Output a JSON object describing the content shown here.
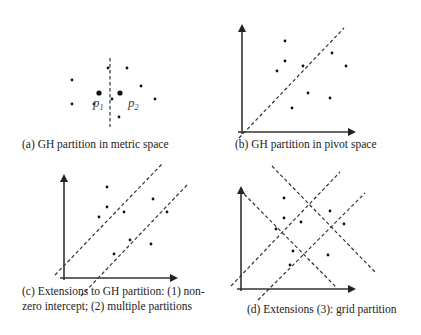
{
  "figure": {
    "panels": [
      {
        "id": "a",
        "caption": "(a) GH partition in metric space",
        "caption_pos": [
          22,
          148
        ],
        "axes": null,
        "dashed_lines": [
          [
            110,
            58,
            110,
            127
          ]
        ],
        "pivots": [
          [
            99,
            93
          ],
          [
            120,
            93
          ]
        ],
        "pivot_labels": [
          {
            "text": "p",
            "sub": "1",
            "x": 93,
            "y": 107
          },
          {
            "text": "p",
            "sub": "2",
            "x": 128,
            "y": 107
          }
        ],
        "points": [
          [
            72,
            80
          ],
          [
            72,
            104
          ],
          [
            94,
            104
          ],
          [
            108,
            68
          ],
          [
            127,
            68
          ],
          [
            141,
            86
          ],
          [
            155,
            99
          ],
          [
            112,
            99
          ],
          [
            119,
            117
          ]
        ]
      },
      {
        "id": "b",
        "caption": "(b) GH partition in pivot space",
        "caption_pos": [
          235,
          148
        ],
        "axes": {
          "origin": [
            242,
            132
          ],
          "y_end": 20,
          "x_end": 360
        },
        "dashed_lines": [
          [
            239,
            138,
            344,
            28
          ]
        ],
        "pivots": [],
        "pivot_labels": [],
        "points": [
          [
            285,
            41
          ],
          [
            285,
            61
          ],
          [
            277,
            71
          ],
          [
            303,
            66
          ],
          [
            332,
            53
          ],
          [
            346,
            66
          ],
          [
            308,
            93
          ],
          [
            330,
            98
          ],
          [
            292,
            108
          ]
        ]
      },
      {
        "id": "c",
        "caption_lines": [
          "(c) Extensions to GH partition: (1) non-",
          "zero intercept; (2) multiple partitions"
        ],
        "caption_pos": [
          22,
          295
        ],
        "caption_line2_y": 310,
        "axes": {
          "origin": [
            64,
            278
          ],
          "y_end": 170,
          "x_end": 182
        },
        "dashed_lines": [
          [
            55,
            275,
            163,
            163
          ],
          [
            81,
            296,
            188,
            184
          ]
        ],
        "pivots": [],
        "pivot_labels": [],
        "points": [
          [
            107,
            187
          ],
          [
            107,
            207
          ],
          [
            99,
            217
          ],
          [
            124,
            212
          ],
          [
            153,
            199
          ],
          [
            167,
            212
          ],
          [
            130,
            240
          ],
          [
            114,
            254
          ],
          [
            151,
            244
          ]
        ]
      },
      {
        "id": "d",
        "caption": "(d) Extensions (3): grid partition",
        "caption_pos": [
          247,
          313
        ],
        "axes": {
          "origin": [
            241,
            289
          ],
          "y_end": 182,
          "x_end": 360
        },
        "dashed_lines": [
          [
            272,
            166,
            375,
            272
          ],
          [
            240,
            190,
            337,
            288
          ],
          [
            231,
            286,
            340,
            172
          ],
          [
            258,
            300,
            365,
            193
          ]
        ],
        "pivots": [],
        "pivot_labels": [],
        "points": [
          [
            284,
            198
          ],
          [
            284,
            218
          ],
          [
            276,
            229
          ],
          [
            301,
            222
          ],
          [
            330,
            211
          ],
          [
            344,
            224
          ],
          [
            293,
            251
          ],
          [
            328,
            255
          ],
          [
            290,
            265
          ]
        ]
      }
    ]
  }
}
